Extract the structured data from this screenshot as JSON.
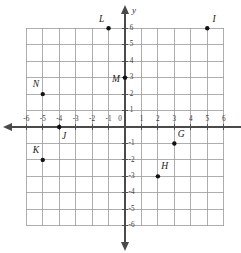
{
  "figure": {
    "kind": "coordinate-plane",
    "axis_labels": {
      "x": "",
      "y": "y"
    },
    "origin_label": "0"
  },
  "chart_data": {
    "type": "scatter",
    "title": "",
    "xlabel": "",
    "ylabel": "y",
    "xlim": [
      -6,
      6
    ],
    "ylim": [
      -6,
      6
    ],
    "grid": true,
    "legend": "none",
    "x_ticks": [
      -6,
      -5,
      -4,
      -3,
      -2,
      -1,
      1,
      2,
      3,
      4,
      5,
      6
    ],
    "y_ticks": [
      6,
      5,
      4,
      3,
      2,
      1,
      -1,
      -2,
      -3,
      -4,
      -5,
      -6
    ],
    "x_tick_labels": [
      "-6",
      "-5",
      "-4",
      "-3",
      "-2",
      "-1",
      "1",
      "2",
      "3",
      "4",
      "5",
      "6"
    ],
    "y_tick_labels": [
      "6",
      "5",
      "4",
      "3",
      "2",
      "1",
      "-1",
      "-2",
      "-3",
      "-4",
      "-5",
      "-6"
    ],
    "points": [
      {
        "label": "G",
        "x": 3,
        "y": -1,
        "label_dx": 0.42,
        "label_dy": 0.55
      },
      {
        "label": "H",
        "x": 2,
        "y": -3,
        "label_dx": 0.42,
        "label_dy": 0.55
      },
      {
        "label": "I",
        "x": 5,
        "y": 6,
        "label_dx": 0.42,
        "label_dy": 0.52
      },
      {
        "label": "J",
        "x": -4,
        "y": 0,
        "label_dx": 0.3,
        "label_dy": -0.62
      },
      {
        "label": "K",
        "x": -5,
        "y": -2,
        "label_dx": -0.42,
        "label_dy": 0.55
      },
      {
        "label": "L",
        "x": -1,
        "y": 6,
        "label_dx": -0.42,
        "label_dy": 0.52
      },
      {
        "label": "M",
        "x": 0,
        "y": 3,
        "label_dx": -0.55,
        "label_dy": -0.15
      },
      {
        "label": "N",
        "x": -5,
        "y": 2,
        "label_dx": -0.42,
        "label_dy": 0.55
      }
    ]
  },
  "colors": {
    "grid": "#9a9a9a",
    "axis": "#4a4a4a",
    "point": "#111111",
    "text": "#1a1a1a",
    "background": "#ffffff"
  }
}
